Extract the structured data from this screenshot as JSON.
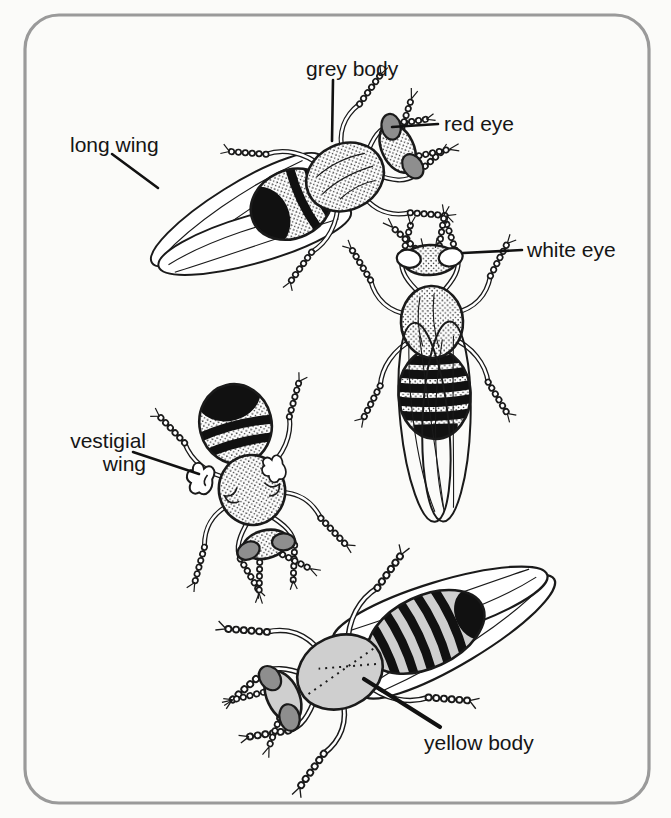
{
  "figure": {
    "type": "labelled line diagram",
    "labels": {
      "long_wing": "long wing",
      "grey_body": "grey body",
      "red_eye": "red eye",
      "white_eye": "white eye",
      "vestigial_line1": "vestigial",
      "vestigial_line2": "wing",
      "yellow_body": "yellow body"
    },
    "flies": [
      {
        "position": "top-left",
        "features": [
          "long wing",
          "grey body",
          "red eye"
        ]
      },
      {
        "position": "middle-right",
        "features": [
          "white eye"
        ]
      },
      {
        "position": "middle-left",
        "features": [
          "vestigial wing"
        ]
      },
      {
        "position": "bottom",
        "features": [
          "yellow body"
        ]
      }
    ],
    "colors": {
      "outline": "#1a1a1a",
      "eye_grey": "#8e8e8e",
      "yellow_body_grey": "#cfcfcf",
      "frame_border": "#9a9a9a",
      "background": "#fbfbf9"
    }
  }
}
